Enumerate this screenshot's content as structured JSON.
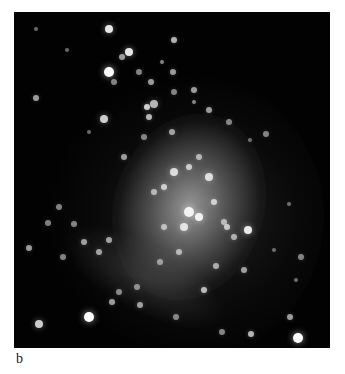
{
  "figure": {
    "panel_label": "b",
    "background_color": "#020202"
  }
}
